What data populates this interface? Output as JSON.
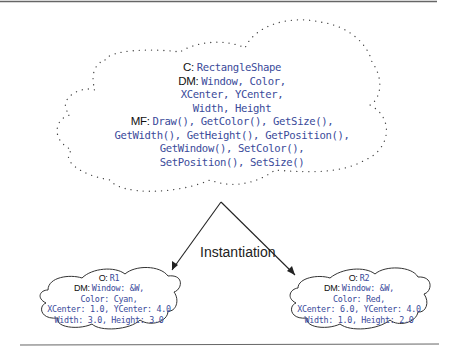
{
  "diagram": {
    "class_cloud": {
      "class_label": "C:",
      "class_name": "RectangleShape",
      "dm_label": "DM:",
      "dm_lines": [
        "Window, Color,",
        "XCenter, YCenter,",
        "Width, Height"
      ],
      "mf_label": "MF:",
      "mf_lines": [
        "Draw(), GetColor(), GetSize(),",
        "GetWidth(), GetHeight(), GetPosition(),",
        "GetWindow(), SetColor(),",
        "SetPosition(), SetSize()"
      ]
    },
    "edge_label": "Instantiation",
    "objects": [
      {
        "object_label": "O:",
        "object_name": "R1",
        "dm_label": "DM:",
        "dm_lines": [
          "Window: &W,",
          "Color: Cyan,",
          "XCenter: 1.0, YCenter: 4.0",
          "Width: 3.0, Height: 3.0"
        ]
      },
      {
        "object_label": "O:",
        "object_name": "R2",
        "dm_label": "DM:",
        "dm_lines": [
          "Window: &W,",
          "Color: Red,",
          "XCenter: 6.0, YCenter: 4.0",
          "Width: 1.0, Height: 2.0"
        ]
      }
    ],
    "colors": {
      "code_text": "#3a4a9a",
      "label_text": "#111111",
      "rule": "#555555",
      "outline": "#333333"
    }
  }
}
